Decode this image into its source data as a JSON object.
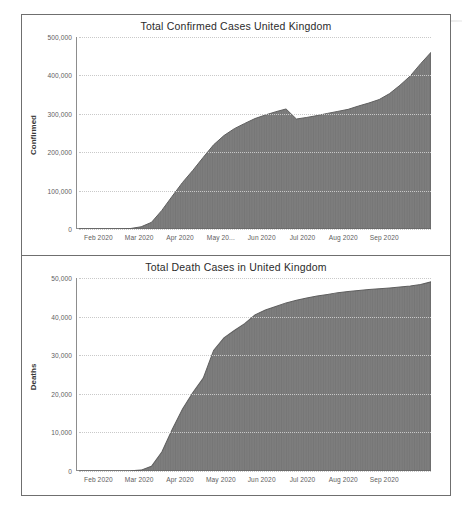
{
  "document": {
    "kind": "scanned-figure-page",
    "background_color": "#ffffff",
    "frame_color": "#6f6f6f"
  },
  "charts": [
    {
      "id": "confirmed",
      "chart_data": {
        "type": "area",
        "title": "Total Confirmed Cases United Kingdom",
        "xlabel": "",
        "ylabel": "Confirmed",
        "ylim": [
          0,
          500000
        ],
        "yticks": [
          0,
          100000,
          200000,
          300000,
          400000,
          500000
        ],
        "ytick_labels": [
          "0",
          "100,000",
          "200,000",
          "300,000",
          "400,000",
          "500,000"
        ],
        "xtick_labels": [
          "Feb 2020",
          "Mar 2020",
          "Apr 2020",
          "May 20...",
          "Jun 2020",
          "Jul 2020",
          "Aug 2020",
          "Sep 2020"
        ],
        "grid": true,
        "legend": "none",
        "fill_color": "#7d7d7d",
        "x": [
          "2020-01-22",
          "2020-02-01",
          "2020-02-15",
          "2020-03-01",
          "2020-03-08",
          "2020-03-15",
          "2020-03-22",
          "2020-03-29",
          "2020-04-05",
          "2020-04-12",
          "2020-04-19",
          "2020-04-26",
          "2020-05-03",
          "2020-05-10",
          "2020-05-17",
          "2020-05-24",
          "2020-05-31",
          "2020-06-07",
          "2020-06-14",
          "2020-06-21",
          "2020-06-28",
          "2020-07-05",
          "2020-07-12",
          "2020-07-19",
          "2020-07-26",
          "2020-08-02",
          "2020-08-09",
          "2020-08-16",
          "2020-08-23",
          "2020-08-30",
          "2020-09-06",
          "2020-09-13",
          "2020-09-20",
          "2020-09-27",
          "2020-10-04"
        ],
        "values": [
          0,
          2,
          9,
          35,
          275,
          1380,
          5740,
          17300,
          48400,
          85200,
          121200,
          152800,
          186600,
          219200,
          243300,
          261200,
          274800,
          287600,
          296900,
          305300,
          312600,
          286400,
          290500,
          295400,
          301000,
          306300,
          311600,
          320300,
          328100,
          337200,
          352600,
          374200,
          398600,
          430500,
          460000
        ]
      }
    },
    {
      "id": "deaths",
      "chart_data": {
        "type": "area",
        "title": "Total Death Cases in United Kingdom",
        "xlabel": "",
        "ylabel": "Deaths",
        "ylim": [
          0,
          50000
        ],
        "yticks": [
          0,
          10000,
          20000,
          30000,
          40000,
          50000
        ],
        "ytick_labels": [
          "0",
          "10,000",
          "20,000",
          "30,000",
          "40,000",
          "50,000"
        ],
        "xtick_labels": [
          "Feb 2020",
          "Mar 2020",
          "Apr 2020",
          "May 2020",
          "Jun 2020",
          "Jul 2020",
          "Aug 2020",
          "Sep 2020"
        ],
        "grid": true,
        "legend": "none",
        "fill_color": "#7d7d7d",
        "x": [
          "2020-01-22",
          "2020-02-01",
          "2020-02-15",
          "2020-03-01",
          "2020-03-08",
          "2020-03-15",
          "2020-03-22",
          "2020-03-29",
          "2020-04-05",
          "2020-04-12",
          "2020-04-19",
          "2020-04-26",
          "2020-05-03",
          "2020-05-10",
          "2020-05-17",
          "2020-05-24",
          "2020-05-31",
          "2020-06-07",
          "2020-06-14",
          "2020-06-21",
          "2020-06-28",
          "2020-07-05",
          "2020-07-12",
          "2020-07-19",
          "2020-07-26",
          "2020-08-02",
          "2020-08-09",
          "2020-08-16",
          "2020-08-23",
          "2020-08-30",
          "2020-09-06",
          "2020-09-13",
          "2020-09-20",
          "2020-09-27",
          "2020-10-04"
        ],
        "values": [
          0,
          0,
          0,
          1,
          4,
          35,
          233,
          1231,
          4943,
          10760,
          16060,
          20319,
          24055,
          31241,
          34466,
          36393,
          38161,
          40465,
          41698,
          42632,
          43550,
          44220,
          44798,
          45318,
          45752,
          46210,
          46526,
          46791,
          46996,
          47212,
          47407,
          47644,
          47902,
          48308,
          49000
        ]
      }
    }
  ]
}
